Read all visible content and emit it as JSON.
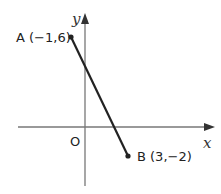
{
  "diagram": {
    "type": "coordinate-plane-line-segment",
    "axes": {
      "x_label": "x",
      "y_label": "y",
      "origin_label": "O"
    },
    "points": [
      {
        "name": "A",
        "label": "A (−1,6)",
        "x": -1,
        "y": 6
      },
      {
        "name": "B",
        "label": "B (3,−2)",
        "x": 3,
        "y": -2
      }
    ],
    "segment": {
      "from": "A",
      "to": "B"
    },
    "colors": {
      "axis": "#777777",
      "segment": "#222222",
      "text": "#222222"
    }
  }
}
